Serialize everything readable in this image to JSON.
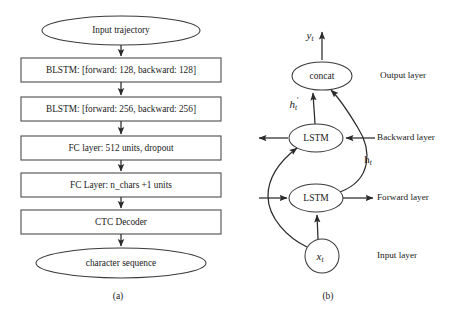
{
  "figure": {
    "panel_a": {
      "caption": "(a)",
      "nodes": [
        {
          "id": "input-trajectory",
          "shape": "ellipse",
          "label": "Input trajectory"
        },
        {
          "id": "blstm-1",
          "shape": "rect",
          "label": "BLSTM: [forward: 128, backward: 128]"
        },
        {
          "id": "blstm-2",
          "shape": "rect",
          "label": "BLSTM: [forward: 256, backward: 256]"
        },
        {
          "id": "fc-1",
          "shape": "rect",
          "label": "FC layer: 512 units, dropout"
        },
        {
          "id": "fc-2",
          "shape": "rect",
          "label": "FC Layer: n_chars +1 units"
        },
        {
          "id": "ctc-decoder",
          "shape": "rect",
          "label": "CTC Decoder"
        },
        {
          "id": "character-sequence",
          "shape": "ellipse",
          "label": "character sequence"
        }
      ]
    },
    "panel_b": {
      "caption": "(b)",
      "nodes": [
        {
          "id": "concat",
          "shape": "ellipse",
          "label": "concat"
        },
        {
          "id": "lstm-backward",
          "shape": "ellipse",
          "label": "LSTM"
        },
        {
          "id": "lstm-forward",
          "shape": "ellipse",
          "label": "LSTM"
        },
        {
          "id": "input-x",
          "shape": "circle",
          "label": "x",
          "subscript": "t"
        }
      ],
      "layer_labels": [
        {
          "id": "output-layer",
          "label": "Output layer"
        },
        {
          "id": "backward-layer",
          "label": "Backward layer"
        },
        {
          "id": "forward-layer",
          "label": "Forward layer"
        },
        {
          "id": "input-layer",
          "label": "Input layer"
        }
      ],
      "variables": [
        {
          "id": "y-t",
          "base": "y",
          "subscript": "t",
          "prime": ""
        },
        {
          "id": "h-prime-t",
          "base": "h",
          "subscript": "t",
          "prime": "'"
        },
        {
          "id": "h-t",
          "base": "h",
          "subscript": "t",
          "prime": ""
        },
        {
          "id": "x-t",
          "base": "x",
          "subscript": "t",
          "prime": ""
        }
      ]
    }
  },
  "colors": {
    "stroke": "#3a3a3a",
    "box_stroke": "#555555",
    "connector": "#2a2a2a",
    "text": "#1a1a1a",
    "background": "#ffffff"
  }
}
